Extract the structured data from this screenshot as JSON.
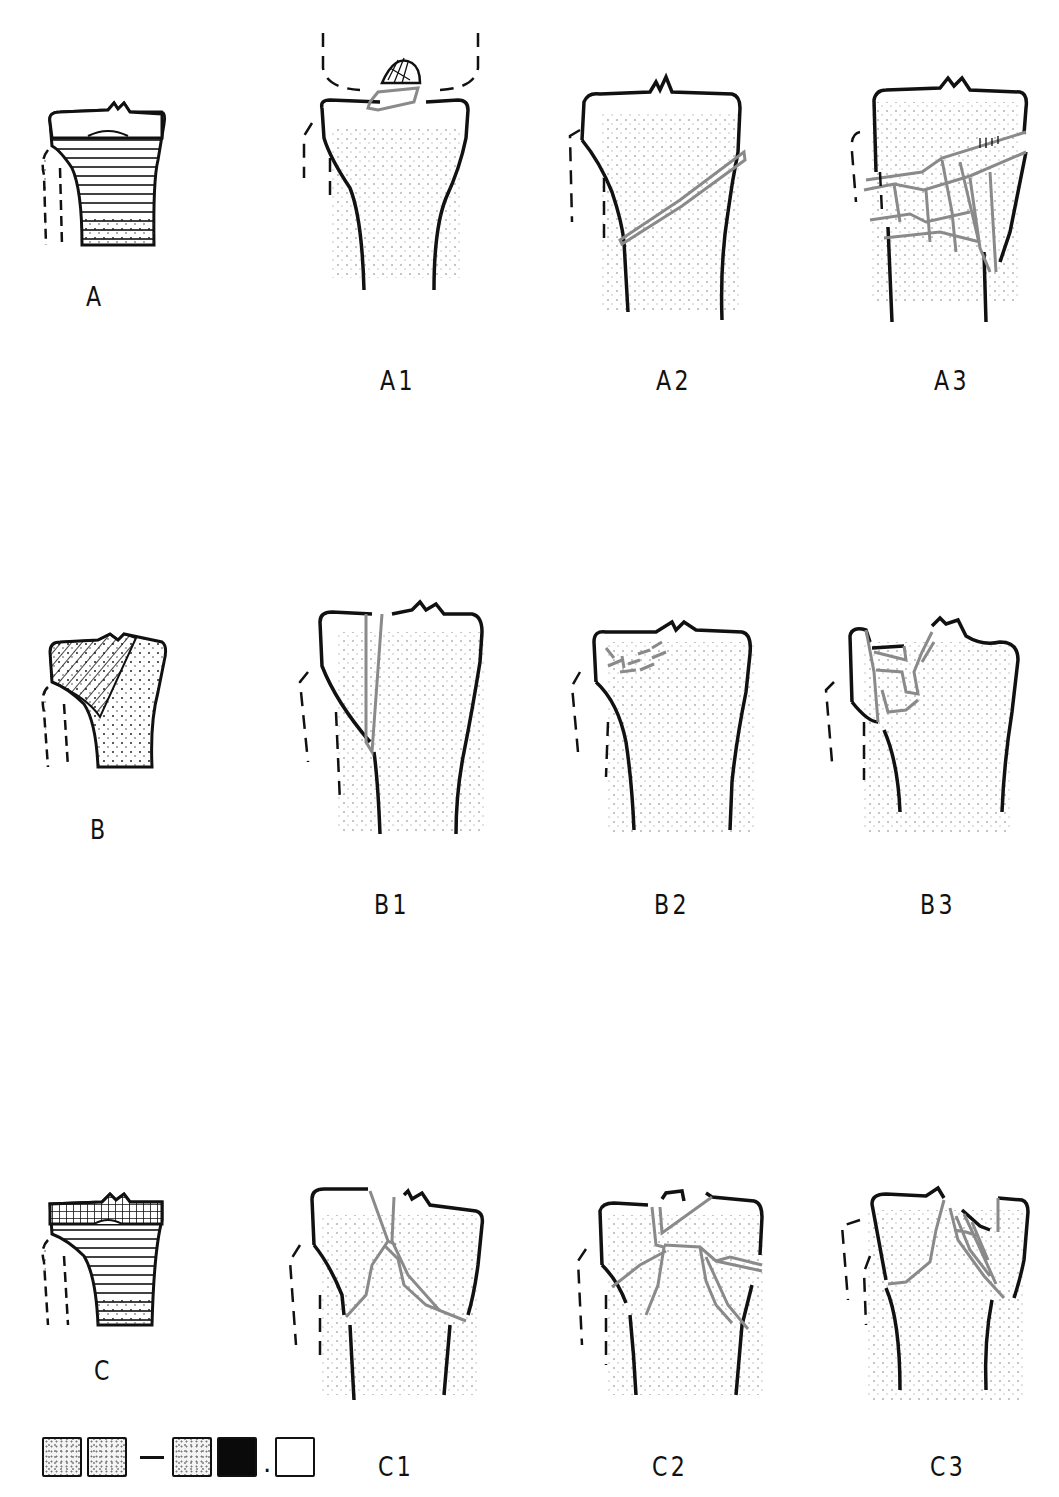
{
  "colors": {
    "bone_outline": "#0a0a0a",
    "fracture_line": "#8a8a8a",
    "stipple": "#777777",
    "background": "#ffffff"
  },
  "rows": [
    {
      "type_label": "A",
      "type_description": "extra-articular (horizontal hatch metaphysis)",
      "subgroups": [
        {
          "label": "A1",
          "description": "avulsion of intercondylar eminence"
        },
        {
          "label": "A2",
          "description": "simple oblique metaphyseal fracture"
        },
        {
          "label": "A3",
          "description": "multifragmentary metaphyseal fracture"
        }
      ]
    },
    {
      "type_label": "B",
      "type_description": "partial articular (diagonal hatch lateral condyle)",
      "subgroups": [
        {
          "label": "B1",
          "description": "pure split"
        },
        {
          "label": "B2",
          "description": "pure depression"
        },
        {
          "label": "B3",
          "description": "split-depression"
        }
      ]
    },
    {
      "type_label": "C",
      "type_description": "complete articular (grid hatch articular surface)",
      "subgroups": [
        {
          "label": "C1",
          "description": "articular simple, metaphyseal simple"
        },
        {
          "label": "C2",
          "description": "articular simple, metaphyseal multifragmentary"
        },
        {
          "label": "C3",
          "description": "articular multifragmentary"
        }
      ]
    }
  ],
  "legend": {
    "code_boxes": [
      "stipple",
      "stipple",
      "dash",
      "stipple",
      "solid",
      "dot",
      "empty"
    ]
  }
}
